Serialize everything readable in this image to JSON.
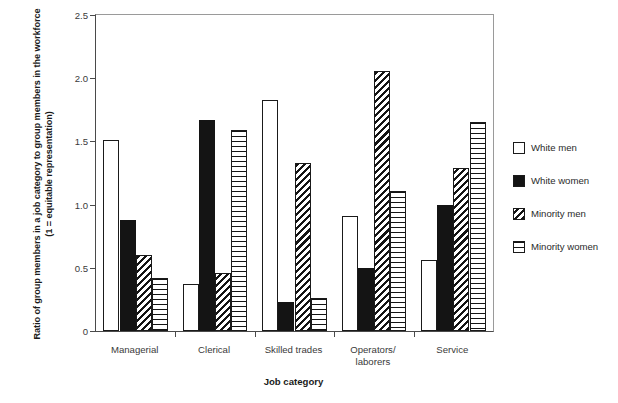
{
  "chart_data": {
    "type": "bar",
    "title": "",
    "xlabel": "Job category",
    "ylabel": "Ratio of group members in a job category to group members in the workforce (1 = equitable representation)",
    "ylim": [
      0,
      2.5
    ],
    "yticks": [
      0,
      0.5,
      1.0,
      1.5,
      2.0,
      2.5
    ],
    "ytick_labels": [
      "0",
      "0.5",
      "1.0",
      "1.5",
      "2.0",
      "2.5"
    ],
    "grid": false,
    "legend_position": "right",
    "categories": [
      "Managerial",
      "Clerical",
      "Skilled trades",
      "Operators/\nlaborers",
      "Service"
    ],
    "series": [
      {
        "name": "White men",
        "pattern": "solid-white",
        "values": [
          1.51,
          0.37,
          1.83,
          0.91,
          0.56
        ]
      },
      {
        "name": "White women",
        "pattern": "solid-black",
        "values": [
          0.88,
          1.67,
          0.23,
          0.5,
          1.0
        ]
      },
      {
        "name": "Minority men",
        "pattern": "diagonal-hatch",
        "values": [
          0.6,
          0.46,
          1.33,
          2.06,
          1.29
        ]
      },
      {
        "name": "Minority women",
        "pattern": "horizontal-stripe",
        "values": [
          0.42,
          1.59,
          0.26,
          1.11,
          1.65
        ]
      }
    ]
  },
  "legend": {
    "items": [
      {
        "label": "White men"
      },
      {
        "label": "White women"
      },
      {
        "label": "Minority men"
      },
      {
        "label": "Minority women"
      }
    ]
  },
  "colors": {
    "bar_fill": "#141414",
    "bar_outline": "#1a1a1a",
    "axis": "#4a4a4a",
    "background": "#ffffff"
  }
}
